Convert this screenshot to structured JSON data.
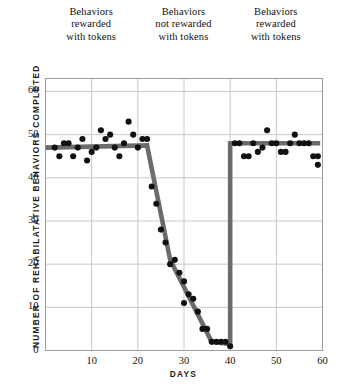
{
  "figure": {
    "phase_headers": [
      {
        "id": "phase-a1",
        "lines": [
          "Behaviors",
          "rewarded",
          "with tokens"
        ]
      },
      {
        "id": "phase-b",
        "lines": [
          "Behaviors",
          "not rewarded",
          "with tokens"
        ]
      },
      {
        "id": "phase-a2",
        "lines": [
          "Behaviors",
          "rewarded",
          "with tokens"
        ]
      }
    ],
    "colors": {
      "trend_line": "#6b6b6b",
      "point": "#111111",
      "grid": "#c8c8c8",
      "frame": "#9a9a9a",
      "text": "#111111"
    }
  },
  "chart_data": {
    "type": "scatter",
    "title": "",
    "xlabel": "DAYS",
    "ylabel": "NUMBER OF REHABILATATIVE BEHAVIORS COMPLETED",
    "xlim": [
      0,
      60
    ],
    "ylim": [
      0,
      63
    ],
    "xticks": [
      10,
      20,
      30,
      40,
      50,
      60
    ],
    "yticks": [
      0,
      10,
      20,
      30,
      40,
      50,
      60
    ],
    "grid": true,
    "legend": null,
    "phases": [
      {
        "name": "Behaviors rewarded with tokens",
        "x_start": 0,
        "x_end": 21
      },
      {
        "name": "Behaviors not rewarded with tokens",
        "x_start": 21,
        "x_end": 40
      },
      {
        "name": "Behaviors rewarded with tokens",
        "x_start": 40,
        "x_end": 60
      }
    ],
    "points": [
      {
        "x": 2,
        "y": 47
      },
      {
        "x": 3,
        "y": 45
      },
      {
        "x": 4,
        "y": 48
      },
      {
        "x": 5,
        "y": 48
      },
      {
        "x": 6,
        "y": 45
      },
      {
        "x": 7,
        "y": 47
      },
      {
        "x": 8,
        "y": 49
      },
      {
        "x": 9,
        "y": 44
      },
      {
        "x": 10,
        "y": 46
      },
      {
        "x": 11,
        "y": 47
      },
      {
        "x": 12,
        "y": 51
      },
      {
        "x": 13,
        "y": 49
      },
      {
        "x": 14,
        "y": 50
      },
      {
        "x": 15,
        "y": 47
      },
      {
        "x": 16,
        "y": 45
      },
      {
        "x": 17,
        "y": 48
      },
      {
        "x": 18,
        "y": 53
      },
      {
        "x": 19,
        "y": 50
      },
      {
        "x": 20,
        "y": 47
      },
      {
        "x": 21,
        "y": 49
      },
      {
        "x": 22,
        "y": 49
      },
      {
        "x": 23,
        "y": 38
      },
      {
        "x": 24,
        "y": 34
      },
      {
        "x": 25,
        "y": 28
      },
      {
        "x": 26,
        "y": 25
      },
      {
        "x": 27,
        "y": 20
      },
      {
        "x": 28,
        "y": 21
      },
      {
        "x": 29,
        "y": 18
      },
      {
        "x": 30,
        "y": 16
      },
      {
        "x": 30,
        "y": 11
      },
      {
        "x": 31,
        "y": 13
      },
      {
        "x": 32,
        "y": 12
      },
      {
        "x": 33,
        "y": 9
      },
      {
        "x": 34,
        "y": 5
      },
      {
        "x": 35,
        "y": 5
      },
      {
        "x": 36,
        "y": 2
      },
      {
        "x": 37,
        "y": 2
      },
      {
        "x": 38,
        "y": 2
      },
      {
        "x": 39,
        "y": 2
      },
      {
        "x": 40,
        "y": 1
      },
      {
        "x": 41,
        "y": 48
      },
      {
        "x": 42,
        "y": 48
      },
      {
        "x": 43,
        "y": 45
      },
      {
        "x": 44,
        "y": 45
      },
      {
        "x": 45,
        "y": 48
      },
      {
        "x": 46,
        "y": 46
      },
      {
        "x": 47,
        "y": 47
      },
      {
        "x": 48,
        "y": 51
      },
      {
        "x": 49,
        "y": 48
      },
      {
        "x": 50,
        "y": 48
      },
      {
        "x": 51,
        "y": 46
      },
      {
        "x": 52,
        "y": 46
      },
      {
        "x": 53,
        "y": 48
      },
      {
        "x": 54,
        "y": 50
      },
      {
        "x": 55,
        "y": 48
      },
      {
        "x": 56,
        "y": 48
      },
      {
        "x": 57,
        "y": 48
      },
      {
        "x": 58,
        "y": 45
      },
      {
        "x": 59,
        "y": 45
      },
      {
        "x": 59,
        "y": 43
      }
    ],
    "trend_line": [
      {
        "x": 0,
        "y": 47
      },
      {
        "x": 22,
        "y": 47.5
      },
      {
        "x": 27,
        "y": 21
      },
      {
        "x": 36,
        "y": 2
      },
      {
        "x": 40,
        "y": 1.5
      },
      {
        "x": 40,
        "y": 48
      },
      {
        "x": 59.5,
        "y": 48
      }
    ]
  }
}
